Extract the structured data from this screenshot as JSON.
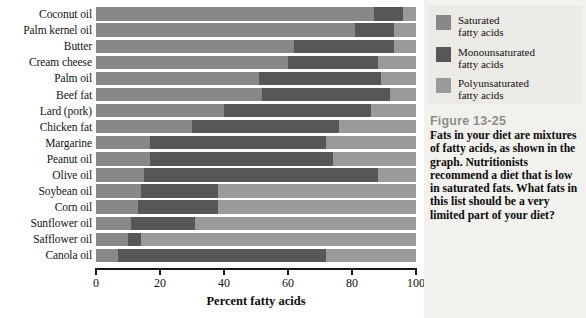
{
  "chart_data": {
    "type": "bar",
    "orientation": "horizontal",
    "stacked": true,
    "title": "",
    "xlabel": "Percent fatty acids",
    "ylabel": "",
    "xlim": [
      0,
      100
    ],
    "xticks": [
      0,
      20,
      40,
      60,
      80,
      100
    ],
    "grid": false,
    "legend_position": "right",
    "categories": [
      "Coconut oil",
      "Palm kernel oil",
      "Butter",
      "Cream cheese",
      "Palm oil",
      "Beef fat",
      "Lard (pork)",
      "Chicken fat",
      "Margarine",
      "Peanut oil",
      "Olive oil",
      "Soybean oil",
      "Corn oil",
      "Sunflower oil",
      "Safflower oil",
      "Canola oil"
    ],
    "series": [
      {
        "name": "Saturated fatty acids",
        "color": "#888888",
        "values": [
          87,
          81,
          62,
          60,
          51,
          52,
          40,
          30,
          17,
          17,
          15,
          14,
          13,
          11,
          10,
          7
        ]
      },
      {
        "name": "Monounsaturated fatty acids",
        "color": "#575757",
        "values": [
          9,
          12,
          31,
          28,
          38,
          40,
          46,
          46,
          55,
          57,
          73,
          24,
          25,
          20,
          4,
          65
        ]
      },
      {
        "name": "Polyunsaturated fatty acids",
        "color": "#9a9a9a",
        "values": [
          4,
          7,
          7,
          12,
          11,
          8,
          14,
          24,
          28,
          26,
          12,
          62,
          62,
          69,
          86,
          28
        ]
      }
    ],
    "totals": [
      100,
      100,
      100,
      100,
      100,
      100,
      100,
      100,
      100,
      100,
      100,
      100,
      100,
      100,
      100,
      100
    ]
  },
  "axis": {
    "tick_labels": [
      "0",
      "20",
      "40",
      "60",
      "80",
      "100"
    ],
    "title": "Percent fatty acids"
  },
  "legend": {
    "items": [
      {
        "label": "Saturated\nfatty acids",
        "color": "#888888",
        "swatch_name": "legend-swatch-saturated"
      },
      {
        "label": "Monounsaturated\nfatty acids",
        "color": "#575757",
        "swatch_name": "legend-swatch-monounsaturated"
      },
      {
        "label": "Polyunsaturated\nfatty acids",
        "color": "#9a9a9a",
        "swatch_name": "legend-swatch-polyunsaturated"
      }
    ]
  },
  "caption": {
    "figure_number": "Figure 13-25",
    "body": "Fats in your diet are mixtures of fatty acids, as shown in the graph. Nutritionists recommend a diet that is low in saturated fats. What fats in this list should be a very limited part of your diet?"
  },
  "colors": {
    "saturated": "#888888",
    "monounsaturated": "#575757",
    "polyunsaturated": "#9a9a9a",
    "panel_background": "#f2f1ee",
    "figure_number_color": "#8e8d8a"
  }
}
